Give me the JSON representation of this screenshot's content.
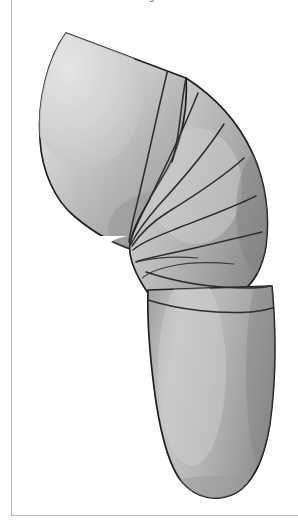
{
  "page": {
    "width": 298,
    "height": 528,
    "background": "#ffffff",
    "caption_clipped": "Fig.",
    "frame_color": "#b9b9b9"
  },
  "figure": {
    "style": "grayscale shaded line illustration",
    "orientation": "lateral view, leg flexed, thigh upper-left, calf lower-right",
    "palette": {
      "highlight": "#dcdcdc",
      "midtone": "#b4b4b4",
      "shadow": "#8f8f8f",
      "deep_shadow": "#6f6f6f",
      "outline": "#1f1f1f",
      "wrap_line": "#2b2b2b",
      "background": "#ffffff"
    },
    "wrap": {
      "name": "spiral figure-eight bandage",
      "thigh_fan_lines": 7,
      "calf_band_lines": 3,
      "convergence_point": "popliteal crease, posterior knee",
      "description": "Elastic bandage turns fan out from the back of the knee across the thigh and encircle the calf in overlapping horizontal bands."
    },
    "regions": [
      {
        "name": "thigh",
        "label": "thigh"
      },
      {
        "name": "knee",
        "label": "knee"
      },
      {
        "name": "popliteal-crease",
        "label": "popliteal crease"
      },
      {
        "name": "calf",
        "label": "calf"
      }
    ]
  }
}
